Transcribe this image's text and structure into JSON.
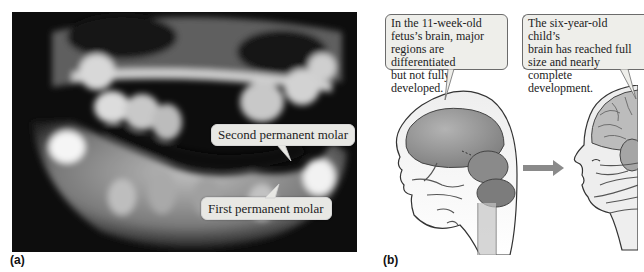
{
  "figure": {
    "panel_a": {
      "label": "(a)",
      "image_description": "Panoramic dental X-ray of a child's jaw",
      "callouts": [
        {
          "text": "Second permanent molar"
        },
        {
          "text": "First permanent molar"
        }
      ]
    },
    "panel_b": {
      "label": "(b)",
      "callouts": [
        {
          "text": "In the 11-week-old\nfetus’s brain, major\nregions are differentiated\nbut not fully developed."
        },
        {
          "text": "The six-year-old child’s\nbrain has reached full\nsize and nearly\ncomplete development."
        }
      ],
      "arrow_icon": "right-arrow-icon"
    },
    "colors": {
      "callout_bg": "#eeeeea",
      "brain_fill": "#8f8f8f",
      "skin_fill": "#eeeeee",
      "arrow": "#8a8a8a"
    }
  }
}
